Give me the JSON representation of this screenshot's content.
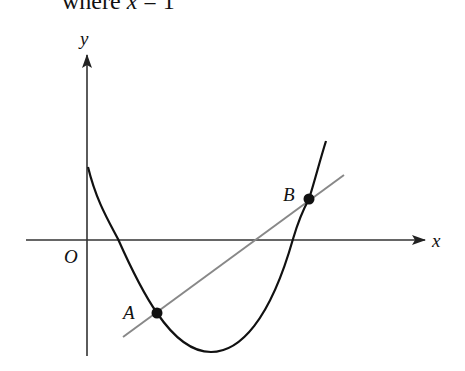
{
  "caption": {
    "prefix": "where ",
    "variable": "x",
    "suffix": " = 1"
  },
  "diagram": {
    "axes": {
      "x_label": "x",
      "y_label": "y",
      "origin_label": "O",
      "color": "#333333"
    },
    "curve": {
      "type": "parabola",
      "color": "#111111",
      "description": "Upward-opening quadratic starting on positive y-axis, crossing x-axis twice, with minimum below x-axis"
    },
    "line": {
      "type": "straight line",
      "color": "#888888",
      "description": "Line with positive gradient intersecting the curve at A and B"
    },
    "points": [
      {
        "label": "A",
        "position": "lower-left intersection of line and curve, below x-axis"
      },
      {
        "label": "B",
        "position": "upper-right intersection of line and curve, above x-axis"
      }
    ]
  }
}
